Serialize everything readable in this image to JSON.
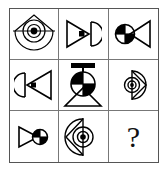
{
  "puzzle": {
    "type": "visual-analogy-matrix",
    "title": "Raven-style 3x3 figure matrix",
    "rows": 3,
    "columns": 3,
    "border_color": "#555555",
    "grid_line_color": "#777777",
    "ink_color": "#000000",
    "background_color": "#ffffff",
    "cells": [
      {
        "index": 1,
        "position": "row1-col1",
        "name": "cell-bullseye-diamond-large",
        "description": "Large circle with concentric bullseye rings, overlapping diamond outline at top, horizontal line through middle",
        "shapes": [
          "circle",
          "concentric-rings",
          "diamond",
          "horizontal-line"
        ],
        "size": "large",
        "is_answer_slot": false,
        "label": ""
      },
      {
        "index": 2,
        "position": "row1-col2",
        "name": "cell-triangle-right-halfcircle",
        "description": "Triangle pointing right containing a small black square, with a D-shaped half circle to its right",
        "shapes": [
          "triangle-right",
          "black-square",
          "half-circle"
        ],
        "size": "medium",
        "is_answer_slot": false,
        "label": ""
      },
      {
        "index": 3,
        "position": "row1-col3",
        "name": "cell-quarter-circle-triangle-left",
        "description": "Circle with alternating black quadrants on the left, triangle pointing left outline to its right",
        "shapes": [
          "quartered-circle",
          "triangle-left"
        ],
        "size": "medium",
        "is_answer_slot": false,
        "label": ""
      },
      {
        "index": 4,
        "position": "row2-col1",
        "name": "cell-halfcircle-triangle-left",
        "description": "D-shaped half circle on the left, triangle pointing left containing a small black square",
        "shapes": [
          "half-circle",
          "triangle-left",
          "black-square"
        ],
        "size": "medium",
        "is_answer_slot": false,
        "label": ""
      },
      {
        "index": 5,
        "position": "row2-col2",
        "name": "cell-quarter-circle-triangle-down-bar",
        "description": "Circle with alternating black quadrants, horizontal bar above it, triangle pointing down beneath",
        "shapes": [
          "quartered-circle",
          "horizontal-bar",
          "triangle-down"
        ],
        "size": "large",
        "is_answer_slot": false,
        "label": ""
      },
      {
        "index": 6,
        "position": "row2-col3",
        "name": "cell-bullseye-diamond-right-small",
        "description": "Small circle with concentric bullseye rings and diamond point extending to the right, vertical line through middle",
        "shapes": [
          "circle",
          "concentric-rings",
          "diamond-right",
          "vertical-line"
        ],
        "size": "small",
        "is_answer_slot": false,
        "label": ""
      },
      {
        "index": 7,
        "position": "row3-col1",
        "name": "cell-triangle-right-quarter-circle",
        "description": "Triangle pointing right with a circle having alternating black quadrants at its tip",
        "shapes": [
          "triangle-right",
          "quartered-circle"
        ],
        "size": "small",
        "is_answer_slot": false,
        "label": ""
      },
      {
        "index": 8,
        "position": "row3-col2",
        "name": "cell-bullseye-diamond-left",
        "description": "Circle with concentric bullseye rings and diamond point extending to the left, vertical line through middle",
        "shapes": [
          "circle",
          "concentric-rings",
          "diamond-left",
          "vertical-line"
        ],
        "size": "medium",
        "is_answer_slot": false,
        "label": ""
      },
      {
        "index": 9,
        "position": "row3-col3",
        "name": "cell-answer-placeholder",
        "description": "Empty answer cell marked with a question mark",
        "shapes": [
          "question-mark"
        ],
        "size": "medium",
        "is_answer_slot": true,
        "label": "?"
      }
    ]
  }
}
